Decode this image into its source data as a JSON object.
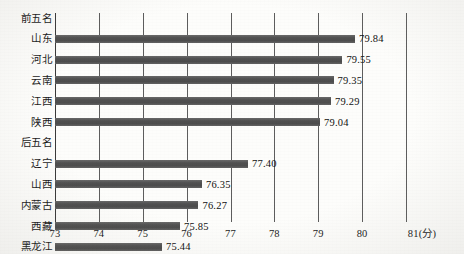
{
  "chart_data": {
    "type": "bar",
    "orientation": "horizontal",
    "title": "",
    "xlabel": "(分)",
    "ylabel": "",
    "xlim": [
      73,
      81
    ],
    "xticks": [
      "73",
      "74",
      "75",
      "76",
      "77",
      "78",
      "79",
      "80",
      "81(分)"
    ],
    "xtick_values": [
      73,
      74,
      75,
      76,
      77,
      78,
      79,
      80,
      81
    ],
    "grid": true,
    "legend": false,
    "bar_color": "#575757",
    "groups": [
      {
        "header": "前五名",
        "categories": [
          "山东",
          "河北",
          "云南",
          "江西",
          "陕西"
        ],
        "values": [
          79.84,
          79.55,
          79.35,
          79.29,
          79.04
        ],
        "labels": [
          "79.84",
          "79.55",
          "79.35",
          "79.29",
          "79.04"
        ]
      },
      {
        "header": "后五名",
        "categories": [
          "辽宁",
          "山西",
          "内蒙古",
          "西藏",
          "黑龙江"
        ],
        "values": [
          77.4,
          76.35,
          76.27,
          75.85,
          75.44
        ],
        "labels": [
          "77.40",
          "76.35",
          "76.27",
          "75.85",
          "75.44"
        ]
      }
    ],
    "rows": [
      {
        "label": "前五名",
        "value": null,
        "value_label": "",
        "is_header": true
      },
      {
        "label": "山东",
        "value": 79.84,
        "value_label": "79.84",
        "is_header": false
      },
      {
        "label": "河北",
        "value": 79.55,
        "value_label": "79.55",
        "is_header": false
      },
      {
        "label": "云南",
        "value": 79.35,
        "value_label": "79.35",
        "is_header": false
      },
      {
        "label": "江西",
        "value": 79.29,
        "value_label": "79.29",
        "is_header": false
      },
      {
        "label": "陕西",
        "value": 79.04,
        "value_label": "79.04",
        "is_header": false
      },
      {
        "label": "后五名",
        "value": null,
        "value_label": "",
        "is_header": true
      },
      {
        "label": "辽宁",
        "value": 77.4,
        "value_label": "77.40",
        "is_header": false
      },
      {
        "label": "山西",
        "value": 76.35,
        "value_label": "76.35",
        "is_header": false
      },
      {
        "label": "内蒙古",
        "value": 76.27,
        "value_label": "76.27",
        "is_header": false
      },
      {
        "label": "西藏",
        "value": 75.85,
        "value_label": "75.85",
        "is_header": false
      },
      {
        "label": "黑龙江",
        "value": 75.44,
        "value_label": "75.44",
        "is_header": false
      }
    ]
  }
}
